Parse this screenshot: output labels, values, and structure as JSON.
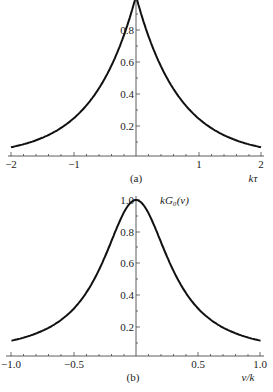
{
  "chart_data": [
    {
      "type": "line",
      "panel": "(a)",
      "xlabel": "kτ",
      "ylabel": "",
      "xlim": [
        -2,
        2
      ],
      "ylim": [
        0,
        1.0
      ],
      "xticks": [
        "−2",
        "−1",
        "1",
        "2"
      ],
      "yticks": [
        "0.2",
        "0.4",
        "0.6",
        "0.8"
      ],
      "grid": false,
      "x": [
        -2,
        -1.5,
        -1,
        -0.75,
        -0.5,
        -0.25,
        0,
        0.25,
        0.5,
        0.75,
        1,
        1.5,
        2
      ],
      "values": [
        0.03,
        0.1,
        0.24,
        0.33,
        0.47,
        0.69,
        1.0,
        0.69,
        0.47,
        0.33,
        0.24,
        0.1,
        0.03
      ]
    },
    {
      "type": "line",
      "panel": "(b)",
      "xlabel": "ν/k",
      "ylabel": "kG₀(ν)",
      "xlim": [
        -1.0,
        1.0
      ],
      "ylim": [
        0,
        1.0
      ],
      "xticks": [
        "−1.0",
        "−0.5",
        "0.5",
        "1.0"
      ],
      "yticks": [
        "0.2",
        "0.4",
        "0.6",
        "0.8",
        "1.0"
      ],
      "grid": false,
      "x": [
        -1.0,
        -0.75,
        -0.5,
        -0.25,
        0,
        0.25,
        0.5,
        0.75,
        1.0
      ],
      "values": [
        0.1,
        0.16,
        0.3,
        0.64,
        1.0,
        0.64,
        0.3,
        0.16,
        0.1
      ]
    }
  ],
  "panel_a": {
    "caption": "(a)",
    "xlabel": "kτ",
    "xticks": [
      "−2",
      "−1",
      "1",
      "2"
    ],
    "yticks": [
      "0.2",
      "0.4",
      "0.6",
      "0.8"
    ]
  },
  "panel_b": {
    "caption": "(b)",
    "xlabel": "ν/k",
    "ylabel": "kG₀(ν)",
    "xticks": [
      "−1.0",
      "−0.5",
      "0.5",
      "1.0"
    ],
    "yticks": [
      "0.2",
      "0.4",
      "0.6",
      "0.8",
      "1.0"
    ]
  }
}
